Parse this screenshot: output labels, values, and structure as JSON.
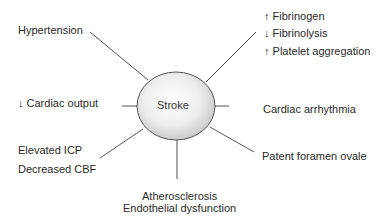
{
  "diagram": {
    "center_label": "Stroke",
    "colors": {
      "line": "#555555",
      "ellipse_stroke": "#555555",
      "ellipse_fill_center": "#ffffff",
      "ellipse_fill_edge": "#cfcfcf",
      "text": "#2a2a2a"
    },
    "factors": {
      "hypertension": "Hypertension",
      "coag": [
        "↑ Fibrinogen",
        "↓ Fibrinolysis",
        "↑ Platelet aggregation"
      ],
      "cardiac_output": "↓ Cardiac output",
      "arrhythmia": "Cardiac arrhythmia",
      "icp": [
        "Elevated ICP",
        "Decreased CBF"
      ],
      "pfo": "Patent foramen ovale",
      "athero": [
        "Atherosclerosis",
        "Endothelial dysfunction"
      ]
    }
  }
}
